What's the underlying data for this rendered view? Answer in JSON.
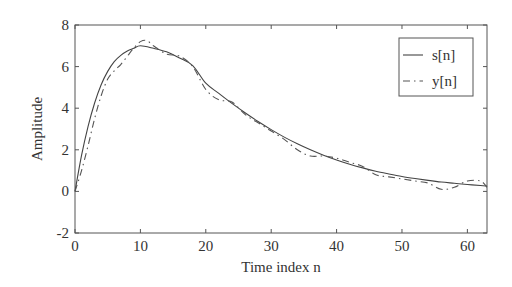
{
  "chart_data": {
    "type": "line",
    "title": "",
    "xlabel": "Time index n",
    "ylabel": "Amplitude",
    "xlim": [
      0,
      63
    ],
    "ylim": [
      -2,
      8
    ],
    "xticks": [
      0,
      10,
      20,
      30,
      40,
      50,
      60
    ],
    "yticks": [
      -2,
      0,
      2,
      4,
      6,
      8
    ],
    "grid": false,
    "legend_position": "upper right",
    "series": [
      {
        "name": "s[n]",
        "style": "solid",
        "x": [
          0,
          1,
          2,
          3,
          4,
          5,
          6,
          7,
          8,
          9,
          10,
          12,
          14,
          16,
          18,
          20,
          22,
          24,
          26,
          28,
          30,
          32,
          34,
          36,
          38,
          40,
          42,
          44,
          46,
          48,
          50,
          52,
          54,
          56,
          58,
          60,
          62,
          63
        ],
        "values": [
          0,
          1.73,
          3.13,
          4.25,
          5.13,
          5.77,
          6.24,
          6.54,
          6.75,
          6.88,
          7.0,
          6.88,
          6.71,
          6.41,
          6.05,
          5.2,
          4.71,
          4.23,
          3.78,
          3.36,
          2.97,
          2.61,
          2.29,
          2.0,
          1.74,
          1.51,
          1.31,
          1.13,
          0.97,
          0.84,
          0.72,
          0.62,
          0.53,
          0.45,
          0.39,
          0.33,
          0.28,
          0.26
        ]
      },
      {
        "name": "y[n]",
        "style": "dashdot",
        "x": [
          0,
          1,
          2,
          3,
          4,
          5,
          6,
          7,
          8,
          9,
          10,
          11,
          12,
          14,
          16,
          18,
          20,
          22,
          24,
          26,
          28,
          30,
          32,
          34,
          36,
          38,
          40,
          42,
          44,
          46,
          48,
          50,
          52,
          54,
          56,
          58,
          60,
          62,
          63
        ],
        "values": [
          0,
          1.0,
          2.2,
          3.5,
          4.6,
          5.4,
          5.8,
          6.1,
          6.5,
          6.9,
          7.2,
          7.25,
          7.0,
          6.6,
          6.5,
          6.0,
          4.9,
          4.4,
          4.3,
          3.7,
          3.3,
          2.9,
          2.5,
          2.0,
          1.7,
          1.7,
          1.6,
          1.4,
          1.2,
          0.8,
          0.7,
          0.6,
          0.5,
          0.4,
          0.1,
          0.2,
          0.5,
          0.5,
          0.2
        ]
      }
    ]
  },
  "legend": {
    "items": [
      {
        "label": "s[n]"
      },
      {
        "label": "y[n]"
      }
    ]
  },
  "axes": {
    "xlabel": "Time index n",
    "ylabel": "Amplitude",
    "xtick_labels": [
      "0",
      "10",
      "20",
      "30",
      "40",
      "50",
      "60"
    ],
    "ytick_labels": [
      "-2",
      "0",
      "2",
      "4",
      "6",
      "8"
    ]
  }
}
